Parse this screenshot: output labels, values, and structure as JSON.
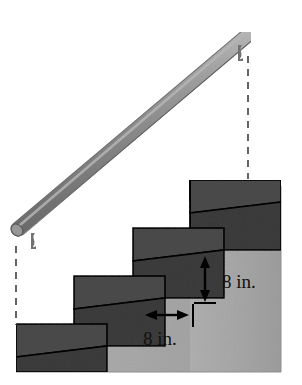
{
  "figure": {
    "background_color": "#ffffff"
  },
  "colors": {
    "wall": "#a9a9a9",
    "wall_edge": "#9a9a9a",
    "riser_face": "#3b3b3b",
    "tread_top": "#4e4e4e",
    "tread_side": "#2f2f2f",
    "outline": "#000000",
    "handrail": "#8b8b8b",
    "handrail_highlight": "#b4b4b4",
    "handrail_shadow": "#6a6a6a",
    "bracket": "#7d7d7d",
    "dashed_line": "#4a4a4a",
    "dimension_text": "#111111"
  },
  "labels": {
    "riser_height": "8 in.",
    "tread_depth": "8 in."
  },
  "annotations": {
    "riser": {
      "name": "vertical-dimension",
      "value": 8,
      "unit": "in.",
      "orientation": "vertical",
      "describes": "step riser height"
    },
    "tread": {
      "name": "horizontal-dimension",
      "value": 8,
      "unit": "in.",
      "orientation": "horizontal",
      "describes": "step tread depth"
    }
  },
  "parts": {
    "handrail_label": "handrail",
    "bracket_lower_label": "lower handrail bracket",
    "bracket_upper_label": "upper handrail bracket",
    "dashed_lower_label": "lower vertical reference line",
    "dashed_upper_label": "upper vertical reference line",
    "wall_label": "background wall",
    "steps_label": "staircase steps",
    "step_count": 4
  }
}
